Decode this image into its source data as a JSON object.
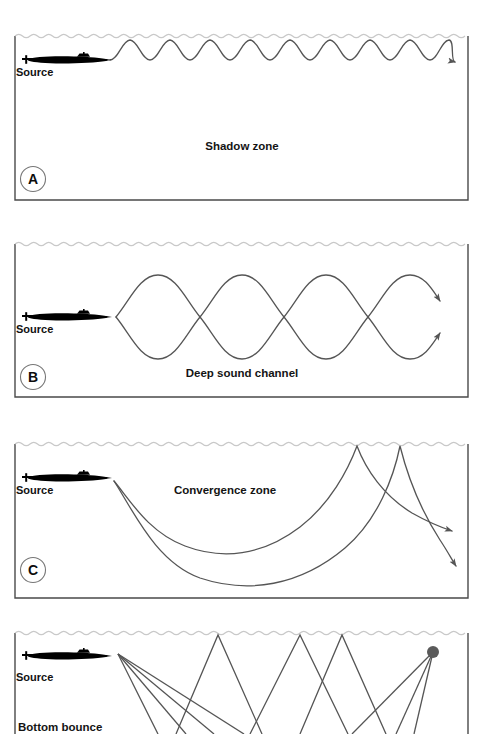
{
  "figure": {
    "background_color": "#ffffff",
    "ray_color": "#555555",
    "surface_color": "#cccccc",
    "border_color": "#4a4a4a",
    "ink_color": "#111111",
    "submarine_color": "#000000",
    "receiver_color": "#5a5a5a",
    "width": 484,
    "height": 734
  },
  "panels": [
    {
      "id": "A",
      "letter": "A",
      "source_label": "Source",
      "zone_label": "Shadow zone",
      "zone_label_x": 242,
      "zone_label_y": 150,
      "x": 15,
      "y": 34,
      "w": 453,
      "h": 166,
      "letter_cx": 33,
      "letter_cy": 179,
      "sub_x": 22,
      "sub_y": 55,
      "sub_scale": 1.0,
      "source_label_x": 16,
      "source_label_y": 76,
      "propagation": "surface-duct-scallops",
      "scallop_count": 9,
      "scallop_start_x": 110,
      "scallop_end_x": 455,
      "scallop_top_y": 39,
      "scallop_bottom_y": 60
    },
    {
      "id": "B",
      "letter": "B",
      "source_label": "Source",
      "zone_label": "Deep sound channel",
      "zone_label_x": 242,
      "zone_label_y": 377,
      "x": 15,
      "y": 242,
      "w": 453,
      "h": 155,
      "letter_cx": 33,
      "letter_cy": 377,
      "sub_x": 22,
      "sub_y": 312,
      "sub_scale": 1.0,
      "source_label_x": 16,
      "source_label_y": 333,
      "propagation": "deep-sound-channel-loops",
      "loop_count": 3,
      "axis_y": 317,
      "loop_start_x": 116,
      "loop_period": 84,
      "loop_amplitude": 40
    },
    {
      "id": "C",
      "letter": "C",
      "source_label": "Source",
      "zone_label": "Convergence zone",
      "zone_label_x": 225,
      "zone_label_y": 494,
      "x": 15,
      "y": 442,
      "w": 453,
      "h": 156,
      "letter_cx": 33,
      "letter_cy": 570,
      "sub_x": 22,
      "sub_y": 473,
      "sub_scale": 1.0,
      "source_label_x": 16,
      "source_label_y": 494,
      "propagation": "convergence-zone-arcs",
      "ray_origin_x": 114,
      "ray_origin_y": 481,
      "arc_count": 2
    },
    {
      "id": "D",
      "letter": "D",
      "source_label": "Source",
      "zone_label": "Bottom bounce",
      "zone_label_x": 18,
      "zone_label_y": 731,
      "x": 15,
      "y": 631,
      "w": 453,
      "h": 103,
      "letter_cx": 33,
      "letter_cy": 760,
      "sub_x": 22,
      "sub_y": 651,
      "sub_scale": 1.0,
      "source_label_x": 16,
      "source_label_y": 681,
      "propagation": "bottom-bounce-zigzag",
      "ray_origin_x": 118,
      "ray_origin_y": 654,
      "receiver_x": 433,
      "receiver_y": 652,
      "receiver_radius": 6,
      "clipped_at_bottom": true
    }
  ],
  "geometry": {
    "surface_wave_amplitude": 2.6,
    "surface_wave_period": 15,
    "ray_stroke_width": 1.3,
    "border_stroke_width": 1.4
  }
}
